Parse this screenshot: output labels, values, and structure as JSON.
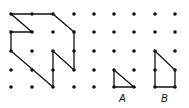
{
  "grid": {
    "columns_x": [
      11,
      32,
      53,
      74,
      94,
      114,
      134,
      155,
      175
    ],
    "rows_y": [
      14,
      32,
      51,
      70,
      87
    ],
    "dot_radius": 1.8,
    "dot_color": "#111111"
  },
  "shapes": {
    "main": {
      "points": [
        [
          11,
          14
        ],
        [
          53,
          14
        ],
        [
          74,
          32
        ],
        [
          74,
          70
        ],
        [
          53,
          51
        ],
        [
          53,
          87
        ],
        [
          11,
          51
        ],
        [
          11,
          32
        ],
        [
          32,
          32
        ],
        [
          11,
          14
        ]
      ],
      "stroke": "#111111"
    },
    "A": {
      "points": [
        [
          114,
          70
        ],
        [
          114,
          87
        ],
        [
          134,
          87
        ]
      ],
      "label": "A",
      "label_x": 119,
      "label_y": 93
    },
    "B": {
      "points": [
        [
          155,
          51
        ],
        [
          175,
          70
        ],
        [
          175,
          87
        ],
        [
          155,
          87
        ]
      ],
      "label": "B",
      "label_x": 161,
      "label_y": 93
    }
  }
}
